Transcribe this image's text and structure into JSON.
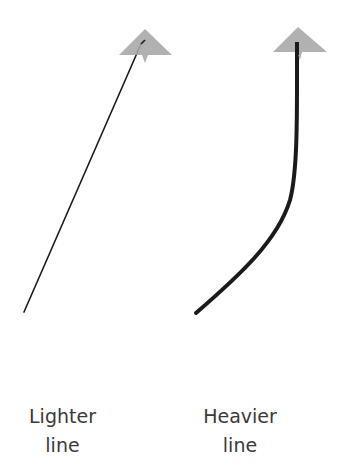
{
  "diagram": {
    "colors": {
      "line": "#1a1a1a",
      "arrowhead": "#a8a8a8",
      "text": "#3a3a3a",
      "background": "#ffffff"
    },
    "arrows": [
      {
        "id": "lighter",
        "label_line1": "Lighter",
        "label_line2": "line",
        "stroke_width": 1.5,
        "shape": "straight"
      },
      {
        "id": "heavier",
        "label_line1": "Heavier",
        "label_line2": "line",
        "stroke_width": 4,
        "shape": "curved"
      }
    ]
  }
}
